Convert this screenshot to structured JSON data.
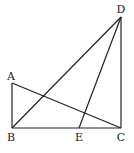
{
  "figure": {
    "points": {
      "A": {
        "label": "A",
        "x": 12,
        "y": 83
      },
      "B": {
        "label": "B",
        "x": 12,
        "y": 128
      },
      "C": {
        "label": "C",
        "x": 121,
        "y": 128
      },
      "D": {
        "label": "D",
        "x": 121,
        "y": 17
      },
      "E": {
        "label": "E",
        "x": 79,
        "y": 128
      }
    },
    "segments": [
      "AB",
      "BC",
      "CD",
      "AC",
      "BD",
      "ED"
    ]
  }
}
